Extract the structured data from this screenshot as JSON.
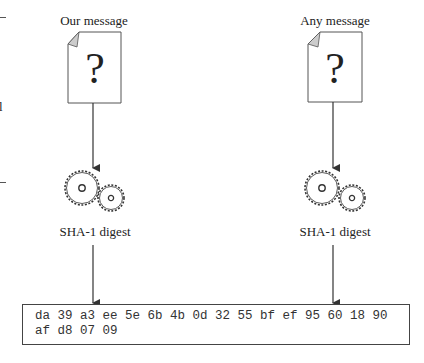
{
  "left_column": {
    "message_label": "Our message",
    "document_glyph": "?",
    "digest_label": "SHA-1 digest"
  },
  "right_column": {
    "message_label": "Any message",
    "document_glyph": "?",
    "digest_label": "SHA-1 digest"
  },
  "output": {
    "hash_line_1": "da 39 a3 ee 5e 6b 4b 0d 32 55 bf ef 95 60 18 90",
    "hash_line_2": "af d8 07 09"
  },
  "icons": {
    "document": "document-question-icon",
    "gears": "gears-icon",
    "arrow": "arrow-down-icon"
  },
  "colors": {
    "stroke": "#444444",
    "text": "#222222",
    "fold": "#cccccc"
  },
  "edge_fragments": {
    "left_clipped_glyph": "l"
  }
}
